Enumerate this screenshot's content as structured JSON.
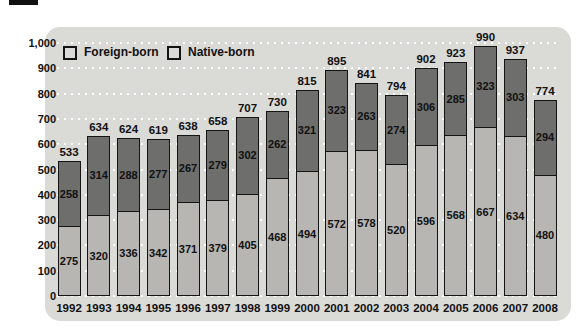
{
  "colors": {
    "page_bg": "#ffffff",
    "panel_bg": "#dadad7",
    "foreign_fill": "#b7b6b2",
    "native_fill": "#6e6e6c",
    "bar_border": "#141414",
    "gridline": "#ffffff",
    "text": "#111111"
  },
  "legend": [
    {
      "label": "Foreign-born",
      "color": "#b7b6b2"
    },
    {
      "label": "Native-born",
      "color": "#6e6e6c"
    }
  ],
  "y_axis": {
    "tick_labels": [
      "1,000",
      "900",
      "800",
      "700",
      "600",
      "500",
      "400",
      "300",
      "200",
      "100",
      "0"
    ],
    "min": 0,
    "max": 1000,
    "step": 100
  },
  "chart_data": {
    "type": "bar",
    "stacked": true,
    "title": "",
    "xlabel": "",
    "ylabel": "",
    "ylim": [
      0,
      1000
    ],
    "grid": "white dotted horizontal lines every 100",
    "legend_position": "top-left inside plot",
    "categories": [
      "1992",
      "1993",
      "1994",
      "1995",
      "1996",
      "1997",
      "1998",
      "1999",
      "2000",
      "2001",
      "2002",
      "2003",
      "2004",
      "2005",
      "2006",
      "2007",
      "2008"
    ],
    "series": [
      {
        "name": "Foreign-born",
        "values": [
          275,
          320,
          336,
          342,
          371,
          379,
          405,
          468,
          494,
          572,
          578,
          520,
          596,
          568,
          667,
          634,
          480
        ]
      },
      {
        "name": "Native-born",
        "values": [
          258,
          314,
          288,
          277,
          267,
          279,
          302,
          262,
          321,
          323,
          263,
          274,
          306,
          285,
          323,
          303,
          294
        ]
      }
    ],
    "totals": [
      533,
      634,
      624,
      619,
      638,
      658,
      707,
      730,
      815,
      895,
      841,
      794,
      902,
      923,
      990,
      937,
      774
    ]
  }
}
